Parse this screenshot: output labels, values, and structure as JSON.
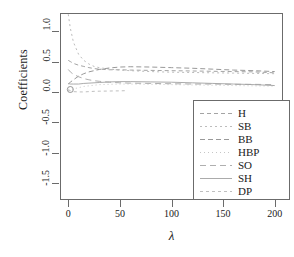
{
  "chart_data": {
    "type": "line",
    "title": "",
    "xlabel": "λ",
    "ylabel": "Coefficients",
    "xlim": [
      -8,
      208
    ],
    "ylim": [
      -1.78,
      1.3
    ],
    "xticks": [
      0,
      50,
      100,
      150,
      200
    ],
    "xtick_labels": [
      "0",
      "50",
      "100",
      "150",
      "200"
    ],
    "yticks": [
      -1.5,
      -1.0,
      -0.5,
      0.0,
      0.5,
      1.0
    ],
    "ytick_labels": [
      "-1.5",
      "-1.0",
      "-0.5",
      "0.0",
      "0.5",
      "1.0"
    ],
    "grid": false,
    "legend_position": "bottom-right",
    "marker_note": "open circle at lambda=2, coefficient=0.04",
    "series": [
      {
        "name": "H",
        "dash": "4,3",
        "color": "#9a9a9a",
        "x": [
          0,
          2,
          5,
          10,
          15,
          20,
          25,
          30,
          40,
          50,
          60,
          80,
          100,
          120,
          140,
          160,
          180,
          200
        ],
        "y": [
          0.52,
          0.5,
          0.47,
          0.44,
          0.42,
          0.4,
          0.385,
          0.375,
          0.365,
          0.365,
          0.36,
          0.355,
          0.35,
          0.345,
          0.34,
          0.335,
          0.33,
          0.315
        ]
      },
      {
        "name": "SB",
        "dash": "2,3",
        "color": "#b4b4b4",
        "x": [
          0,
          2,
          5,
          10,
          15,
          20,
          25,
          30,
          40,
          50,
          60,
          80,
          100,
          120,
          140,
          160,
          180,
          200
        ],
        "y": [
          1.28,
          1.05,
          0.82,
          0.62,
          0.52,
          0.46,
          0.42,
          0.4,
          0.375,
          0.36,
          0.35,
          0.335,
          0.325,
          0.32,
          0.315,
          0.31,
          0.305,
          0.3
        ]
      },
      {
        "name": "BB",
        "dash": "5,3",
        "color": "#8d8d8d",
        "x": [
          0,
          2,
          5,
          10,
          15,
          20,
          25,
          30,
          40,
          50,
          60,
          80,
          100,
          120,
          140,
          160,
          180,
          200
        ],
        "y": [
          0.13,
          0.16,
          0.2,
          0.26,
          0.3,
          0.33,
          0.35,
          0.37,
          0.395,
          0.41,
          0.415,
          0.41,
          0.4,
          0.39,
          0.375,
          0.36,
          0.35,
          0.335
        ]
      },
      {
        "name": "HBP",
        "dash": "1,3",
        "color": "#c0c0c0",
        "x": [
          0,
          2,
          5,
          10,
          15,
          20,
          25,
          30,
          40,
          50,
          60,
          80,
          100,
          120,
          140,
          160,
          180,
          200
        ],
        "y": [
          0.02,
          0.03,
          0.05,
          0.07,
          0.09,
          0.1,
          0.11,
          0.12,
          0.125,
          0.13,
          0.13,
          0.125,
          0.12,
          0.115,
          0.11,
          0.105,
          0.1,
          0.095
        ]
      },
      {
        "name": "SO",
        "dash": "6,4",
        "color": "#a6a6a6",
        "x": [
          0,
          2,
          5,
          10,
          15,
          20,
          25,
          30,
          40,
          50,
          60,
          80,
          100,
          120,
          140,
          160,
          180,
          200
        ],
        "y": [
          0.37,
          0.33,
          0.29,
          0.25,
          0.22,
          0.2,
          0.185,
          0.175,
          0.16,
          0.15,
          0.145,
          0.14,
          0.135,
          0.13,
          0.13,
          0.125,
          0.125,
          0.12
        ]
      },
      {
        "name": "SH",
        "dash": "none",
        "color": "#a2a2a2",
        "x": [
          0,
          2,
          5,
          10,
          15,
          20,
          25,
          30,
          40,
          50,
          60,
          80,
          100,
          120,
          140,
          160,
          180,
          200
        ],
        "y": [
          0.14,
          0.13,
          0.13,
          0.13,
          0.14,
          0.145,
          0.15,
          0.155,
          0.165,
          0.17,
          0.17,
          0.165,
          0.16,
          0.15,
          0.14,
          0.13,
          0.12,
          0.105
        ]
      },
      {
        "name": "DP",
        "dash": "3,3",
        "color": "#b8b8b8",
        "x": [
          0,
          2,
          5,
          10,
          15,
          20,
          25,
          30,
          40,
          50,
          55
        ],
        "y": [
          0.04,
          0.02,
          0.005,
          0.0,
          0.0,
          0.005,
          0.01,
          0.012,
          0.015,
          0.018,
          0.02
        ]
      }
    ]
  },
  "legend": {
    "entries": [
      {
        "label": "H"
      },
      {
        "label": "SB"
      },
      {
        "label": "BB"
      },
      {
        "label": "HBP"
      },
      {
        "label": "SO"
      },
      {
        "label": "SH"
      },
      {
        "label": "DP"
      }
    ]
  }
}
